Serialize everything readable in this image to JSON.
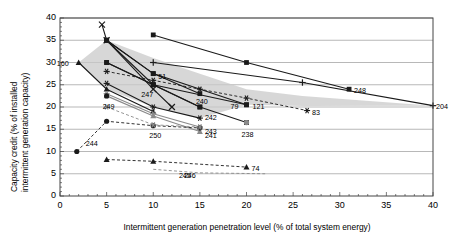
{
  "chart_data": {
    "type": "scatter",
    "title": "",
    "subtitle": "",
    "xlabel": "Intermittent generation penetration level (% of total system energy)",
    "ylabel": "Capacity credit (% of installed intermittent generation capacity)",
    "ylabel_line1": "Capacity credit (% of installed",
    "ylabel_line2": "intermittent generation capacity)",
    "xlim": [
      0,
      40
    ],
    "ylim": [
      0,
      40
    ],
    "xticks": [
      0,
      5,
      10,
      15,
      20,
      25,
      30,
      35,
      40
    ],
    "yticks": [
      0,
      5,
      10,
      15,
      20,
      25,
      30,
      35,
      40
    ],
    "xtick_labels": [
      "0",
      "5",
      "10",
      "15",
      "20",
      "25",
      "30",
      "35",
      "40"
    ],
    "ytick_labels": [
      "0",
      "5",
      "10",
      "15",
      "20",
      "25",
      "30",
      "35",
      "40"
    ],
    "grid": "horizontal",
    "legend": "none",
    "shaded_band": {
      "name": "range-of-published-estimates",
      "color": "#c9c9c9",
      "opacity": 0.75,
      "upper": [
        [
          2.0,
          30.0
        ],
        [
          5.0,
          35.0
        ],
        [
          10.0,
          31.0
        ],
        [
          15.0,
          27.5
        ],
        [
          20.0,
          24.0
        ],
        [
          26.0,
          22.5
        ],
        [
          40.0,
          20.3
        ]
      ],
      "lower": [
        [
          2.0,
          30.0
        ],
        [
          5.0,
          24.0
        ],
        [
          10.0,
          20.0
        ],
        [
          15.0,
          17.5
        ],
        [
          20.0,
          20.5
        ],
        [
          26.0,
          20.2
        ],
        [
          40.0,
          20.3
        ]
      ]
    },
    "series": [
      {
        "name": "160",
        "label": "160",
        "marker": "triangle",
        "line": "solid",
        "color": "#1a1a1a",
        "label_anchor": "left",
        "points": [
          [
            2.0,
            30.0
          ],
          [
            5.0,
            24.0
          ],
          [
            10.0,
            19.0
          ]
        ]
      },
      {
        "name": "51",
        "label": "51",
        "marker": "square",
        "line": "solid",
        "color": "#1a1a1a",
        "label_anchor": "right",
        "points": [
          [
            5.0,
            35.0
          ],
          [
            10.0,
            27.5
          ],
          [
            15.0,
            23.0
          ]
        ]
      },
      {
        "name": "247",
        "label": "247",
        "marker": "square",
        "line": "solid",
        "color": "#1a1a1a",
        "label_anchor": "below",
        "points": [
          [
            5.0,
            30.0
          ],
          [
            10.0,
            25.0
          ],
          [
            15.0,
            20.0
          ]
        ]
      },
      {
        "name": "240",
        "label": "240",
        "marker": "square",
        "line": "solid",
        "color": "#1a1a1a",
        "label_anchor": "above",
        "points": [
          [
            5.0,
            35.0
          ],
          [
            10.0,
            25.0
          ],
          [
            15.0,
            20.0
          ],
          [
            20.0,
            16.5
          ]
        ]
      },
      {
        "name": "242",
        "label": "242",
        "marker": "star",
        "line": "solid",
        "color": "#1a1a1a",
        "label_anchor": "right",
        "points": [
          [
            5.0,
            25.3
          ],
          [
            10.0,
            20.0
          ],
          [
            15.0,
            17.5
          ]
        ]
      },
      {
        "name": "243",
        "label": "243",
        "marker": "asterisk",
        "line": "solid",
        "color": "#8a8a8a",
        "label_anchor": "right",
        "points": [
          [
            5.0,
            23.0
          ],
          [
            10.0,
            18.5
          ],
          [
            15.0,
            15.5
          ]
        ]
      },
      {
        "name": "241",
        "label": "241",
        "marker": "triangle",
        "line": "solid",
        "color": "#8a8a8a",
        "label_anchor": "right",
        "points": [
          [
            5.0,
            22.5
          ],
          [
            10.0,
            18.0
          ],
          [
            15.0,
            14.5
          ]
        ]
      },
      {
        "name": "248",
        "label": "248",
        "marker": "square",
        "line": "solid",
        "color": "#1a1a1a",
        "label_anchor": "right",
        "points": [
          [
            10.0,
            36.2
          ],
          [
            20.0,
            30.0
          ],
          [
            31.0,
            24.0
          ]
        ]
      },
      {
        "name": "204",
        "label": "204",
        "marker": "plus",
        "line": "solid",
        "color": "#1a1a1a",
        "label_anchor": "right",
        "points": [
          [
            10.0,
            30.0
          ],
          [
            26.0,
            25.5
          ],
          [
            40.0,
            20.3
          ]
        ]
      },
      {
        "name": "121",
        "label": "121",
        "marker": "square",
        "line": "solid",
        "color": "#1a1a1a",
        "label_anchor": "right",
        "points": [
          [
            5.0,
            35.0
          ],
          [
            10.0,
            27.5
          ],
          [
            20.0,
            20.5
          ]
        ]
      },
      {
        "name": "79",
        "label": "79",
        "marker": "square",
        "line": "solid",
        "color": "#1a1a1a",
        "label_anchor": "left",
        "points": [
          [
            5.0,
            30.0
          ],
          [
            10.0,
            25.0
          ],
          [
            20.0,
            20.5
          ]
        ]
      },
      {
        "name": "83",
        "label": "83",
        "marker": "star",
        "line": "dashed",
        "color": "#1a1a1a",
        "label_anchor": "right",
        "points": [
          [
            5.0,
            28.0
          ],
          [
            10.0,
            26.0
          ],
          [
            15.0,
            24.0
          ],
          [
            20.0,
            22.0
          ],
          [
            26.5,
            19.2
          ]
        ]
      },
      {
        "name": "x-top",
        "label": "",
        "marker": "x",
        "line": "solid",
        "color": "#1a1a1a",
        "label_anchor": "none",
        "points": [
          [
            4.5,
            38.5
          ],
          [
            5.0,
            35.0
          ],
          [
            10.0,
            24.0
          ],
          [
            12.0,
            20.0
          ]
        ]
      },
      {
        "name": "249",
        "label": "249",
        "marker": "circle",
        "line": "none",
        "color": "#1a1a1a",
        "label_anchor": "below",
        "points": [
          [
            5.0,
            22.5
          ]
        ]
      },
      {
        "name": "244",
        "label": "244",
        "marker": "circle",
        "line": "dashed",
        "color": "#1a1a1a",
        "label_anchor": "right",
        "points": [
          [
            1.8,
            10.0
          ],
          [
            5.0,
            16.8
          ],
          [
            10.0,
            15.8
          ],
          [
            15.0,
            15.3
          ]
        ]
      },
      {
        "name": "250",
        "label": "250",
        "marker": "asterisk",
        "line": "dashed",
        "color": "#8a8a8a",
        "label_anchor": "below",
        "points": [
          [
            5.0,
            20.0
          ],
          [
            10.0,
            16.0
          ],
          [
            15.0,
            15.5
          ]
        ]
      },
      {
        "name": "238",
        "label": "238",
        "marker": "circle",
        "line": "none",
        "color": "#8a8a8a",
        "label_anchor": "below",
        "points": [
          [
            20.0,
            16.5
          ]
        ]
      },
      {
        "name": "74",
        "label": "74",
        "marker": "triangle",
        "line": "dashed",
        "color": "#1a1a1a",
        "label_anchor": "right",
        "points": [
          [
            5.0,
            8.2
          ],
          [
            10.0,
            7.8
          ],
          [
            20.0,
            6.5
          ]
        ]
      },
      {
        "name": "246",
        "label": "246",
        "marker": "none",
        "line": "dashed",
        "color": "#8a8a8a",
        "label_anchor": "center",
        "points": [
          [
            10.0,
            6.0
          ],
          [
            15.0,
            5.2
          ],
          [
            22.0,
            5.0
          ]
        ]
      },
      {
        "name": "245",
        "label": "245",
        "marker": "none",
        "line": "none",
        "color": "#8a8a8a",
        "label_anchor": "center",
        "points": [
          [
            13.5,
            5.0
          ]
        ]
      }
    ],
    "data_labels": [
      {
        "text": "160",
        "x": 2.0,
        "y": 30.0,
        "dx": -22,
        "dy": 0
      },
      {
        "text": "51",
        "x": 10.0,
        "y": 27.5,
        "dx": 5,
        "dy": 2
      },
      {
        "text": "247",
        "x": 10.0,
        "y": 25.0,
        "dx": -12,
        "dy": 9
      },
      {
        "text": "240",
        "x": 15.0,
        "y": 20.0,
        "dx": -4,
        "dy": -6
      },
      {
        "text": "242",
        "x": 15.0,
        "y": 17.5,
        "dx": 5,
        "dy": -1
      },
      {
        "text": "243",
        "x": 15.0,
        "y": 15.5,
        "dx": 5,
        "dy": 4
      },
      {
        "text": "241",
        "x": 15.0,
        "y": 14.5,
        "dx": 5,
        "dy": 4
      },
      {
        "text": "248",
        "x": 31.0,
        "y": 24.0,
        "dx": 5,
        "dy": 1
      },
      {
        "text": "204",
        "x": 40.0,
        "y": 20.3,
        "dx": 3,
        "dy": 0
      },
      {
        "text": "121",
        "x": 20.0,
        "y": 20.5,
        "dx": 6,
        "dy": 1
      },
      {
        "text": "79",
        "x": 20.0,
        "y": 20.5,
        "dx": -16,
        "dy": 1
      },
      {
        "text": "83",
        "x": 26.5,
        "y": 19.2,
        "dx": 5,
        "dy": 1
      },
      {
        "text": "249",
        "x": 5.0,
        "y": 22.5,
        "dx": -4,
        "dy": 10
      },
      {
        "text": "244",
        "x": 1.8,
        "y": 10.0,
        "dx": 9,
        "dy": -9
      },
      {
        "text": "250",
        "x": 10.0,
        "y": 16.0,
        "dx": -4,
        "dy": 10
      },
      {
        "text": "238",
        "x": 20.0,
        "y": 16.5,
        "dx": -5,
        "dy": 11
      },
      {
        "text": "74",
        "x": 20.0,
        "y": 6.5,
        "dx": 5,
        "dy": 1
      },
      {
        "text": "246",
        "x": 13.5,
        "y": 5.0,
        "dx": -2,
        "dy": 1
      },
      {
        "text": "245",
        "x": 13.5,
        "y": 5.0,
        "dx": -7,
        "dy": 1
      }
    ]
  }
}
